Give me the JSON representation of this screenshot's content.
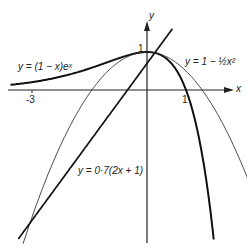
{
  "chart_data": {
    "type": "line",
    "title": "",
    "xlabel": "x",
    "ylabel": "y",
    "x_ticks": [
      {
        "value": -3,
        "label": "-3"
      },
      {
        "value": 1,
        "label": "1"
      }
    ],
    "y_ticks": [
      {
        "value": 1,
        "label": "1"
      }
    ],
    "xlim": [
      -3.5,
      2.2
    ],
    "ylim": [
      -4.0,
      1.8
    ],
    "grid": false,
    "series": [
      {
        "name": "y = (1 − x)eˣ",
        "expression": "(1-x)*exp(x)",
        "style": "thick",
        "x_range": [
          -3.5,
          1.9
        ]
      },
      {
        "name": "y = 1 − ½x²",
        "expression": "1-0.5*x^2",
        "style": "thin",
        "x_range": [
          -3.3,
          2.9
        ]
      },
      {
        "name": "y = 0·7(2x + 1)",
        "expression": "0.7*(2*x+1)",
        "style": "thick",
        "x_range": [
          -3.3,
          0.65
        ]
      }
    ]
  },
  "labels": {
    "curve_exp": "y = (1 − x)eˣ",
    "curve_parab": "y = 1 − ½x²",
    "line": "y = 0·7(2x + 1)",
    "x_axis": "x",
    "y_axis": "y",
    "tick_x_neg3": "-3",
    "tick_x_1": "1",
    "tick_y_1": "1"
  }
}
